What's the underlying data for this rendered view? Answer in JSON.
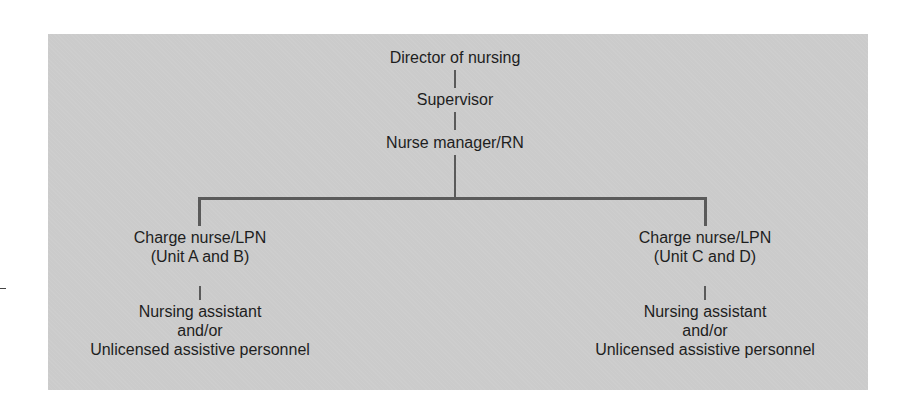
{
  "diagram": {
    "type": "org-chart",
    "levels": {
      "top": "Director of nursing",
      "second": "Supervisor",
      "third": "Nurse manager/RN"
    },
    "branches": [
      {
        "charge_nurse": "Charge nurse/LPN",
        "units": "(Unit A and B)",
        "staff_line1": "Nursing assistant",
        "staff_line2": "and/or",
        "staff_line3": "Unlicensed assistive personnel"
      },
      {
        "charge_nurse": "Charge nurse/LPN",
        "units": "(Unit C and D)",
        "staff_line1": "Nursing assistant",
        "staff_line2": "and/or",
        "staff_line3": "Unlicensed assistive personnel"
      }
    ],
    "colors": {
      "panel": "#cbcbcb",
      "lines": "#5a5a5a",
      "text": "#1e1e1e"
    }
  }
}
